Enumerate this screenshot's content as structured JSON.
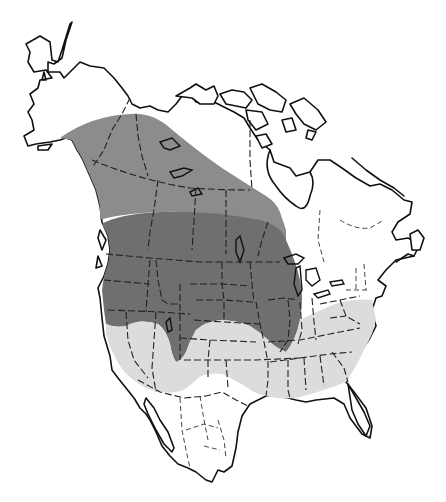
{
  "map": {
    "region": "North America",
    "type": "species range map",
    "colors": {
      "background": "#ffffff",
      "land": "#ffffff",
      "outline": "#111111",
      "range_medium": "#8c8c8c",
      "range_dark": "#6f6f6f",
      "range_light": "#dcdcdc"
    },
    "layers": [
      {
        "id": "range-medium",
        "shade": "medium gray",
        "extent": "Alaska interior, Yukon, NW Territories, western Canada to Hudson Bay"
      },
      {
        "id": "range-dark",
        "shade": "dark gray",
        "extent": "southern Canadian prairies, northern and central United States to Great Lakes"
      },
      {
        "id": "range-light",
        "shade": "light gray",
        "extent": "southern United States from California to Atlantic coast"
      }
    ]
  }
}
